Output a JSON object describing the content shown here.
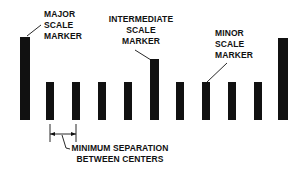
{
  "diagram": {
    "colors": {
      "background": "#ffffff",
      "ink": "#111111"
    },
    "markers": [
      {
        "type": "major",
        "x": 20,
        "top": 37,
        "width": 10
      },
      {
        "type": "minor",
        "x": 46,
        "top": 82,
        "width": 8
      },
      {
        "type": "minor",
        "x": 72,
        "top": 82,
        "width": 8
      },
      {
        "type": "minor",
        "x": 98,
        "top": 82,
        "width": 8
      },
      {
        "type": "minor",
        "x": 124,
        "top": 82,
        "width": 8
      },
      {
        "type": "intermediate",
        "x": 150,
        "top": 59,
        "width": 9
      },
      {
        "type": "minor",
        "x": 176,
        "top": 82,
        "width": 8
      },
      {
        "type": "minor",
        "x": 202,
        "top": 82,
        "width": 8
      },
      {
        "type": "minor",
        "x": 228,
        "top": 82,
        "width": 8
      },
      {
        "type": "minor",
        "x": 254,
        "top": 82,
        "width": 8
      },
      {
        "type": "major",
        "x": 278,
        "top": 38,
        "width": 10
      }
    ],
    "baseline_y": 120,
    "labels": {
      "major": [
        "MAJOR",
        "SCALE",
        "MARKER"
      ],
      "intermediate": [
        "INTERMEDIATE",
        "SCALE",
        "MARKER"
      ],
      "minor": [
        "MINOR",
        "SCALE",
        "MARKER"
      ],
      "separation": [
        "MINIMUM SEPARATION",
        "BETWEEN CENTERS"
      ]
    }
  }
}
